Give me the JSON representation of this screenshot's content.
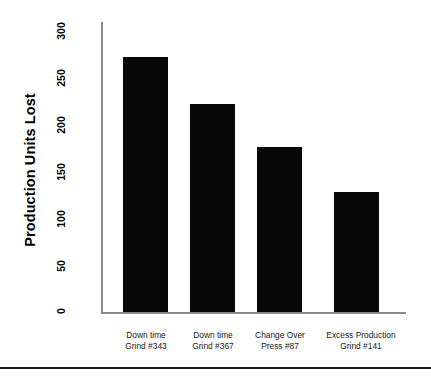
{
  "chart_data": {
    "type": "bar",
    "title": "",
    "xlabel": "",
    "ylabel": "Production Units Lost",
    "categories": [
      "Down time Grind #343",
      "Down time Grind #367",
      "Change Over Press #87",
      "Excess Production Grind #141"
    ],
    "category_lines": [
      [
        "Down time",
        "Grind #343"
      ],
      [
        "Down time",
        "Grind #367"
      ],
      [
        "Change Over",
        "Press #87"
      ],
      [
        "Excess Production",
        "Grind #141"
      ]
    ],
    "values": [
      263,
      214,
      170,
      124
    ],
    "ylim": [
      0,
      300
    ],
    "yticks": [
      0,
      50,
      100,
      150,
      200,
      250,
      300
    ],
    "ytick_labels": [
      "0",
      "50",
      "100",
      "150",
      "200",
      "250",
      "300"
    ],
    "grid": false,
    "legend": null,
    "bar_color": "#080808",
    "axis_color": "#8a8a8a"
  },
  "axes": {
    "y_title": "Production Units Lost",
    "y_ticks": [
      "300",
      "250",
      "200",
      "150",
      "100",
      "50",
      "0"
    ]
  }
}
